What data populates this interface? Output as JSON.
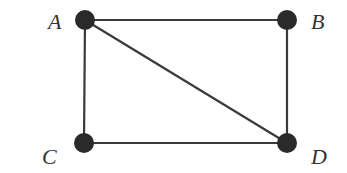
{
  "graph": {
    "nodes": [
      {
        "id": "A",
        "label": "A",
        "x": 85,
        "y": 20,
        "lx": 48,
        "ly": 29
      },
      {
        "id": "B",
        "label": "B",
        "x": 287,
        "y": 20,
        "lx": 311,
        "ly": 29
      },
      {
        "id": "C",
        "label": "C",
        "x": 84,
        "y": 143,
        "lx": 42,
        "ly": 164
      },
      {
        "id": "D",
        "label": "D",
        "x": 287,
        "y": 143,
        "lx": 311,
        "ly": 164
      }
    ],
    "edges": [
      {
        "from": "A",
        "to": "B"
      },
      {
        "from": "A",
        "to": "C"
      },
      {
        "from": "A",
        "to": "D"
      },
      {
        "from": "B",
        "to": "D"
      },
      {
        "from": "C",
        "to": "D"
      }
    ],
    "node_radius": 10,
    "colors": {
      "node": "#2a2a2a",
      "edge": "#3a3a3a",
      "label": "#333333"
    }
  }
}
